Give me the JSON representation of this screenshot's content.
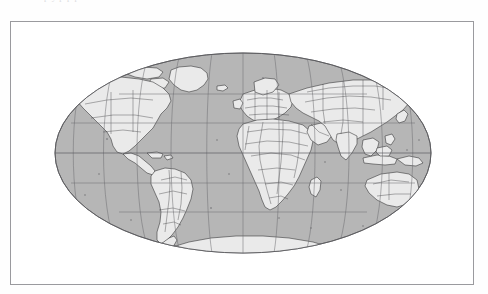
{
  "page": {
    "background_color": "#ffffff",
    "cropped_text_above": "p y  p  p p"
  },
  "figure": {
    "name": "world-map-figure",
    "frame_color": "#9a9a9e",
    "frame": {
      "x": 10,
      "y": 21,
      "width": 464,
      "height": 264
    }
  },
  "map": {
    "title": "",
    "projection": "Mollweide",
    "central_meridian": 0,
    "ocean_color": "#b6b6b6",
    "land_color": "#eaeaea",
    "coastline_color": "#2c2c2e",
    "border_color": "#3a3a3c",
    "graticule_color": "#6e6e72",
    "graticule": {
      "meridian_interval_deg": 30,
      "parallel_interval_deg": 30,
      "meridians": [
        -180,
        -150,
        -120,
        -90,
        -60,
        -30,
        0,
        30,
        60,
        90,
        120,
        150,
        180
      ],
      "parallels": [
        -60,
        -30,
        0,
        30,
        60
      ]
    },
    "ellipse": {
      "cx": 232,
      "cy": 131,
      "rx": 188,
      "ry": 100
    },
    "continents": [
      "North America",
      "South America",
      "Europe",
      "Africa",
      "Asia",
      "Australia",
      "Antarctica",
      "Greenland"
    ],
    "features": [
      "country-borders",
      "coastlines",
      "graticule",
      "islands"
    ]
  }
}
